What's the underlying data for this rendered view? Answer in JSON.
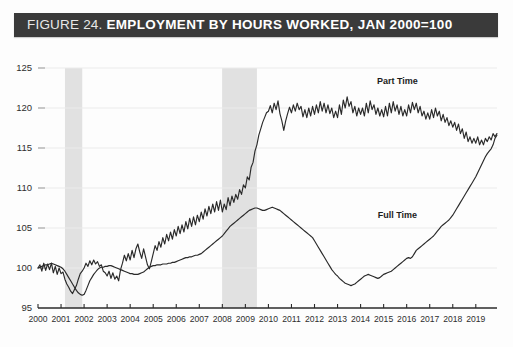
{
  "title": {
    "prefix": "FIGURE 24.",
    "main": "EMPLOYMENT BY HOURS WORKED, JAN 2000=100",
    "bar_color": "#3a3a3a",
    "text_color": "#ffffff"
  },
  "chart_data": {
    "type": "line",
    "title": "EMPLOYMENT BY HOURS WORKED, JAN 2000=100",
    "xlabel": "",
    "ylabel": "",
    "ylim": [
      95,
      125
    ],
    "yticks": [
      95,
      100,
      105,
      110,
      115,
      120,
      125
    ],
    "xlim": [
      2000,
      2019.92
    ],
    "xticks": [
      2000,
      2001,
      2002,
      2003,
      2004,
      2005,
      2006,
      2007,
      2008,
      2009,
      2010,
      2011,
      2012,
      2013,
      2014,
      2015,
      2016,
      2017,
      2018,
      2019
    ],
    "xtick_labels": [
      "2000",
      "2001",
      "2002",
      "2003",
      "2004",
      "2005",
      "2006",
      "2007",
      "2008",
      "2009",
      "2010",
      "2011",
      "2012",
      "2013",
      "2014",
      "2015",
      "2016",
      "2017",
      "2018",
      "2019"
    ],
    "grid": true,
    "legend_position": "inline-annotation",
    "line_color": "#2a2a2a",
    "shading_color": "#e1e1e1",
    "shaded_regions": [
      {
        "name": "recession-2001",
        "start": 2001.17,
        "end": 2001.92
      },
      {
        "name": "recession-2008",
        "start": 2007.99,
        "end": 2009.5
      }
    ],
    "annotations": [
      {
        "text": "Part Time",
        "x": 2015.6,
        "y": 123.0
      },
      {
        "text": "Full Time",
        "x": 2015.6,
        "y": 106.3
      }
    ],
    "series": [
      {
        "name": "Part Time",
        "x_start": 2000.0,
        "x_step": 0.08333,
        "values": [
          100.0,
          100.4,
          99.6,
          100.6,
          99.7,
          100.5,
          99.8,
          100.6,
          99.4,
          100.2,
          99.2,
          100.0,
          99.3,
          99.5,
          98.6,
          98.0,
          97.6,
          97.1,
          96.8,
          97.3,
          97.8,
          98.6,
          99.3,
          99.6,
          100.0,
          100.6,
          100.2,
          100.9,
          100.4,
          101.0,
          100.5,
          100.8,
          100.2,
          100.4,
          99.6,
          99.4,
          99.0,
          99.6,
          98.7,
          99.4,
          98.6,
          99.0,
          98.4,
          99.8,
          100.6,
          101.6,
          100.9,
          101.8,
          101.0,
          102.2,
          101.3,
          102.4,
          103.0,
          102.0,
          101.2,
          102.4,
          101.4,
          100.4,
          99.9,
          100.8,
          101.8,
          102.8,
          102.2,
          103.3,
          102.6,
          103.8,
          103.0,
          104.2,
          103.4,
          104.5,
          103.6,
          104.8,
          104.0,
          105.2,
          104.3,
          105.4,
          104.5,
          105.8,
          104.9,
          106.2,
          105.2,
          106.4,
          105.4,
          106.6,
          105.8,
          107.0,
          106.1,
          107.4,
          106.5,
          107.7,
          106.8,
          108.0,
          107.0,
          108.3,
          107.2,
          108.5,
          107.0,
          108.0,
          107.3,
          108.8,
          107.8,
          109.0,
          108.2,
          109.2,
          108.6,
          109.8,
          109.2,
          110.4,
          110.0,
          111.4,
          111.0,
          112.6,
          113.2,
          114.6,
          115.4,
          116.6,
          117.4,
          118.2,
          118.8,
          119.4,
          119.6,
          120.3,
          119.4,
          120.6,
          119.8,
          120.9,
          119.3,
          118.4,
          117.2,
          118.4,
          119.3,
          120.1,
          119.4,
          120.4,
          119.6,
          120.6,
          119.8,
          120.2,
          118.9,
          119.8,
          118.8,
          120.0,
          119.0,
          120.2,
          119.2,
          120.4,
          119.4,
          120.8,
          119.6,
          120.6,
          119.4,
          120.4,
          119.3,
          120.0,
          118.8,
          119.6,
          118.8,
          120.4,
          119.2,
          121.0,
          120.0,
          121.4,
          120.2,
          120.8,
          119.4,
          120.2,
          119.0,
          120.0,
          119.2,
          120.0,
          119.0,
          120.6,
          119.4,
          120.9,
          119.8,
          120.4,
          119.2,
          120.0,
          119.0,
          119.8,
          118.9,
          120.2,
          119.0,
          120.6,
          119.4,
          120.8,
          119.6,
          120.4,
          119.2,
          120.2,
          119.0,
          119.8,
          119.0,
          120.4,
          119.4,
          120.7,
          119.8,
          120.6,
          119.4,
          120.2,
          119.0,
          119.6,
          118.6,
          119.4,
          118.6,
          119.8,
          118.8,
          120.0,
          119.0,
          119.6,
          118.4,
          119.2,
          118.2,
          118.8,
          117.8,
          118.4,
          117.6,
          118.2,
          117.2,
          118.0,
          116.8,
          117.4,
          116.2,
          117.0,
          115.8,
          116.4,
          115.6,
          116.2,
          115.6,
          116.4,
          115.4,
          116.0,
          115.4,
          116.2,
          115.8,
          116.4,
          116.0,
          116.8,
          116.4,
          116.8
        ]
      },
      {
        "name": "Full Time",
        "x_start": 2000.0,
        "x_step": 0.08333,
        "values": [
          100.0,
          100.1,
          100.2,
          100.3,
          100.4,
          100.4,
          100.5,
          100.6,
          100.5,
          100.4,
          100.3,
          100.2,
          100.1,
          99.9,
          99.6,
          99.2,
          98.8,
          98.4,
          98.0,
          97.6,
          97.2,
          96.9,
          96.7,
          96.6,
          96.7,
          97.2,
          97.8,
          98.4,
          98.8,
          99.2,
          99.5,
          99.8,
          100.0,
          100.1,
          100.1,
          100.2,
          100.2,
          100.3,
          100.3,
          100.2,
          100.1,
          100.0,
          99.9,
          99.8,
          99.7,
          99.6,
          99.5,
          99.4,
          99.3,
          99.3,
          99.2,
          99.2,
          99.2,
          99.3,
          99.4,
          99.5,
          99.7,
          99.9,
          100.1,
          100.2,
          100.3,
          100.3,
          100.4,
          100.4,
          100.4,
          100.5,
          100.5,
          100.5,
          100.6,
          100.6,
          100.7,
          100.7,
          100.8,
          100.9,
          101.0,
          101.1,
          101.2,
          101.3,
          101.3,
          101.4,
          101.4,
          101.5,
          101.6,
          101.6,
          101.7,
          101.8,
          102.0,
          102.2,
          102.4,
          102.6,
          102.8,
          103.0,
          103.2,
          103.4,
          103.6,
          103.8,
          104.0,
          104.3,
          104.6,
          104.9,
          105.2,
          105.4,
          105.6,
          105.8,
          106.0,
          106.2,
          106.4,
          106.6,
          106.8,
          107.0,
          107.2,
          107.3,
          107.4,
          107.5,
          107.5,
          107.4,
          107.3,
          107.2,
          107.2,
          107.3,
          107.4,
          107.5,
          107.6,
          107.5,
          107.4,
          107.3,
          107.2,
          107.0,
          106.8,
          106.6,
          106.4,
          106.2,
          106.0,
          105.8,
          105.6,
          105.4,
          105.2,
          105.0,
          104.8,
          104.6,
          104.4,
          104.2,
          104.0,
          103.8,
          103.4,
          103.0,
          102.6,
          102.2,
          101.8,
          101.4,
          101.0,
          100.6,
          100.2,
          99.8,
          99.5,
          99.2,
          99.0,
          98.7,
          98.5,
          98.3,
          98.1,
          98.0,
          97.9,
          97.8,
          97.9,
          98.0,
          98.2,
          98.4,
          98.6,
          98.8,
          99.0,
          99.1,
          99.2,
          99.1,
          99.0,
          98.9,
          98.8,
          98.7,
          98.8,
          99.0,
          99.2,
          99.3,
          99.4,
          99.5,
          99.6,
          99.8,
          100.0,
          100.2,
          100.4,
          100.6,
          100.8,
          101.0,
          101.2,
          101.3,
          101.2,
          101.4,
          101.8,
          102.2,
          102.4,
          102.6,
          102.8,
          103.0,
          103.2,
          103.4,
          103.6,
          103.8,
          104.0,
          104.3,
          104.6,
          104.9,
          105.2,
          105.4,
          105.6,
          105.8,
          106.0,
          106.3,
          106.6,
          107.0,
          107.4,
          107.8,
          108.2,
          108.6,
          109.0,
          109.4,
          109.8,
          110.2,
          110.6,
          111.0,
          111.4,
          111.9,
          112.4,
          112.9,
          113.4,
          113.9,
          114.3,
          114.6,
          114.9,
          115.4,
          116.2,
          116.6
        ]
      }
    ]
  }
}
